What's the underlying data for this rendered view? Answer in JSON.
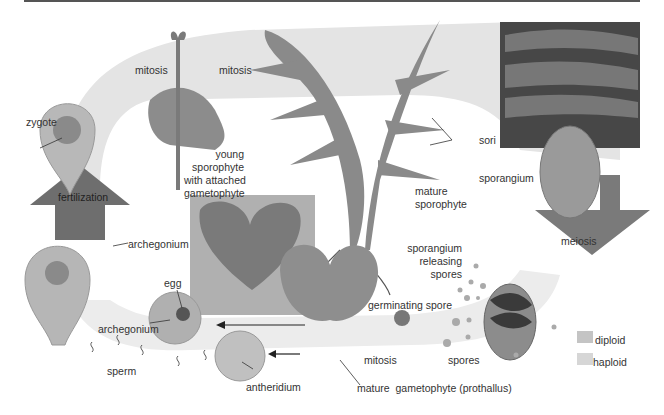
{
  "diagram": {
    "labels": {
      "zygote": "zygote",
      "mitosis_1": "mitosis",
      "mitosis_2": "mitosis",
      "young_sporophyte": [
        "young",
        "sporophyte",
        "with attached",
        "gametophyte"
      ],
      "sori": "sori",
      "mature_sporophyte": [
        "mature",
        "sporophyte"
      ],
      "sporangium": "sporangium",
      "meiosis": "meiosis",
      "sporangium_releasing": [
        "sporangium",
        "releasing",
        "spores"
      ],
      "fertilization": "fertilization",
      "archegonium_1": "archegonium",
      "egg": "egg",
      "archegonium_2": "archegonium",
      "germinating_spore": "germinating spore",
      "sperm": "sperm",
      "antheridium": "antheridium",
      "mitosis_3": "mitosis",
      "spores": "spores",
      "mature_gametophyte": "mature  gametophyte (prothallus)"
    },
    "legend": [
      {
        "label": "diploid",
        "color": "#c4c4c4"
      },
      {
        "label": "haploid",
        "color": "#d6d6d6"
      }
    ],
    "colors": {
      "diploid_band": "#e2e2e2",
      "haploid_band": "#ececec",
      "arrow": "#707070",
      "plant": "#8a8a8a",
      "photo": "#4a4a4a"
    }
  }
}
